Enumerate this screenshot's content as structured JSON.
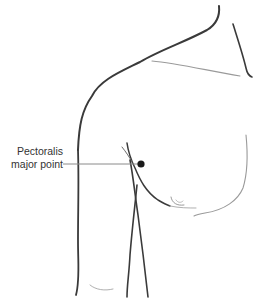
{
  "diagram": {
    "annotation": {
      "line1": "Pectoralis",
      "line2": "major point"
    },
    "point": {
      "x": 141,
      "y": 164,
      "color": "#1a1a1a"
    },
    "colors": {
      "outline_dark": "#3a3a3a",
      "outline_light": "#9a9a9a",
      "leader_line": "#8a8a8a",
      "label_text": "#333333"
    }
  }
}
